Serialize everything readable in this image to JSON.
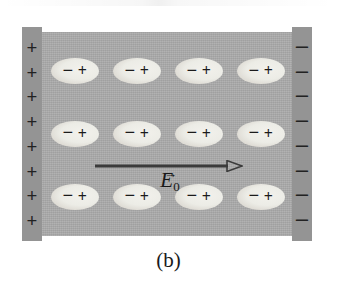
{
  "figure": {
    "label": "(b)",
    "background_color": "#ffffff",
    "slab": {
      "name": "dielectric-slab",
      "fill_color": "#ababab"
    },
    "plates": [
      {
        "name": "left-plate",
        "polarity": "positive",
        "fill_color": "#949494",
        "charge_symbol": "+",
        "charge_count": 8,
        "charges": [
          "+",
          "+",
          "+",
          "+",
          "+",
          "+",
          "+",
          "+"
        ]
      },
      {
        "name": "right-plate",
        "polarity": "negative",
        "fill_color": "#949494",
        "charge_symbol": "−",
        "charge_count": 8,
        "charges": [
          "−",
          "−",
          "−",
          "−",
          "−",
          "−",
          "−",
          "−"
        ]
      }
    ],
    "dipoles": {
      "name": "polarized-molecules",
      "rows": 3,
      "columns": 4,
      "total": 12,
      "negative_sign": "−",
      "positive_sign": "+",
      "fill_color": "#ececE6",
      "orientation": "negative-left-positive-right",
      "items": [
        {
          "negative": "−",
          "positive": "+"
        },
        {
          "negative": "−",
          "positive": "+"
        },
        {
          "negative": "−",
          "positive": "+"
        },
        {
          "negative": "−",
          "positive": "+"
        },
        {
          "negative": "−",
          "positive": "+"
        },
        {
          "negative": "−",
          "positive": "+"
        },
        {
          "negative": "−",
          "positive": "+"
        },
        {
          "negative": "−",
          "positive": "+"
        },
        {
          "negative": "−",
          "positive": "+"
        },
        {
          "negative": "−",
          "positive": "+"
        },
        {
          "negative": "−",
          "positive": "+"
        },
        {
          "negative": "−",
          "positive": "+"
        }
      ]
    },
    "field_arrow": {
      "name": "applied-field-arrow",
      "direction": "right",
      "color": "#3b3b3b",
      "head_style": "open-triangle"
    },
    "field_label": {
      "name": "field-label",
      "vector_accent": "→",
      "symbol": "E",
      "subscript": "0",
      "full_text": "E0"
    }
  }
}
